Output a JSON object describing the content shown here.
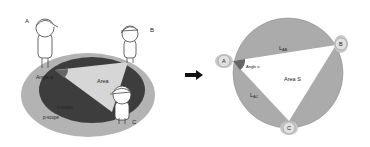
{
  "left_panel": {
    "people": [
      {
        "label": "A"
      },
      {
        "label": "B"
      },
      {
        "label": "C"
      }
    ],
    "angle_label": "Angle a",
    "area_label": "Area",
    "o_scope_label": "o-scope",
    "p_scope_label": "p-scope"
  },
  "arrow": {
    "direction": "right"
  },
  "right_panel": {
    "nodes": [
      {
        "label": "A"
      },
      {
        "label": "B"
      },
      {
        "label": "C"
      }
    ],
    "edge_ab_label": "L",
    "edge_ab_sub": "AB",
    "edge_ac_label": "L",
    "edge_ac_sub": "AC",
    "angle_label": "Angle a",
    "area_label": "Area S"
  },
  "colors": {
    "outer_ellipse": "#b3b3b3",
    "inner_ellipse": "#3d3d3d",
    "triangle_left": "#d6d6d6",
    "circle_fill": "#ababab",
    "triangle_right": "#ffffff",
    "angle_wedge": "#666666",
    "arrow": "#111111"
  }
}
